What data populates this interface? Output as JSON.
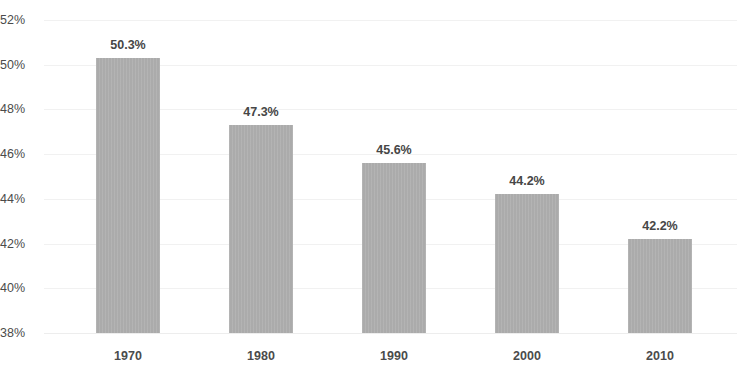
{
  "chart_data": {
    "type": "bar",
    "title": "",
    "subtitle": "",
    "xlabel": "",
    "ylabel": "",
    "categories": [
      "1970",
      "1980",
      "1990",
      "2000",
      "2010"
    ],
    "values": [
      50.3,
      47.3,
      45.6,
      44.2,
      42.2
    ],
    "value_labels": [
      "50.3%",
      "47.3%",
      "45.6%",
      "44.2%",
      "42.2%"
    ],
    "ylim": [
      38,
      52
    ],
    "ytick_values": [
      38,
      40,
      42,
      44,
      46,
      48,
      50,
      52
    ],
    "ytick_labels": [
      "38%",
      "40%",
      "42%",
      "44%",
      "46%",
      "48%",
      "50%",
      "52%"
    ],
    "grid": true,
    "legend": false,
    "series": [
      {
        "name": "",
        "values": [
          50.3,
          47.3,
          45.6,
          44.2,
          42.2
        ]
      }
    ]
  },
  "style": {
    "bar_color": "#ababab",
    "grid_color": "#f1f1f1",
    "tick_text_color": "#4b4b4b",
    "value_text_color": "#464646",
    "background": "#ffffff"
  }
}
